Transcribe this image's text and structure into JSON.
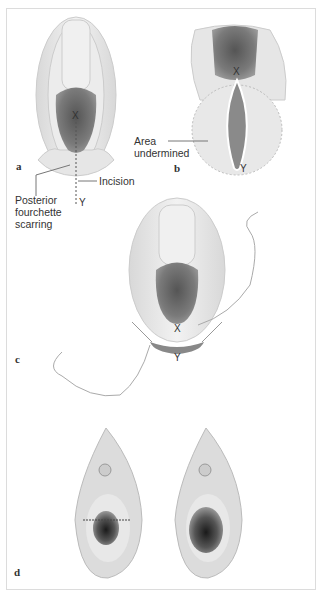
{
  "figure": {
    "panels": [
      {
        "id": "a",
        "label": "a",
        "annotations": {
          "x_mark": "X",
          "y_mark": "Y",
          "incision": "Incision",
          "scarring": "Posterior\nfourchette\nscarring"
        }
      },
      {
        "id": "b",
        "label": "b",
        "annotations": {
          "x_mark": "X",
          "y_mark": "Y",
          "area": "Area\nundermined"
        }
      },
      {
        "id": "c",
        "label": "c",
        "annotations": {
          "x_mark": "X",
          "y_mark": "Y"
        }
      },
      {
        "id": "d",
        "label": "d",
        "annotations": {}
      }
    ],
    "colors": {
      "tissue": "#e6e6e6",
      "tissue_dark": "#6e6e6e",
      "line": "#777777",
      "text": "#333333"
    }
  }
}
